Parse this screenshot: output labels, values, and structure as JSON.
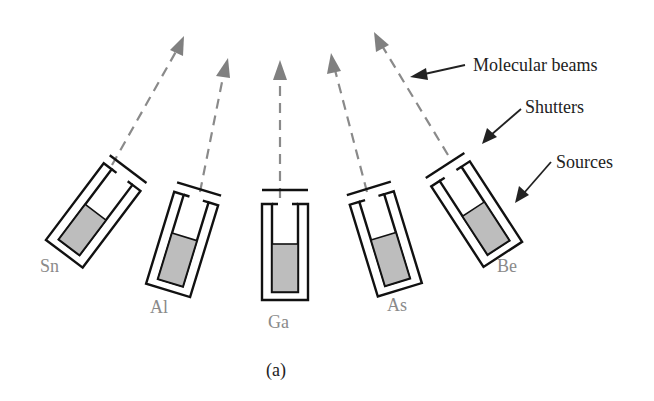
{
  "figure": {
    "caption": "(a)",
    "callouts": {
      "molecular_beams": "Molecular beams",
      "shutters": "Shutters",
      "sources": "Sources"
    },
    "sources": [
      {
        "label": "Sn",
        "angle": 37,
        "cx": 90,
        "cy": 218,
        "label_x": 40,
        "label_y": 272
      },
      {
        "label": "Al",
        "angle": 17,
        "cx": 180,
        "cy": 248,
        "label_x": 150,
        "label_y": 313
      },
      {
        "label": "Ga",
        "angle": 0,
        "cx": 284,
        "cy": 256,
        "label_x": 268,
        "label_y": 328
      },
      {
        "label": "As",
        "angle": -17,
        "cx": 386,
        "cy": 248,
        "label_x": 387,
        "label_y": 311
      },
      {
        "label": "Be",
        "angle": -33,
        "cx": 478,
        "cy": 218,
        "label_x": 497,
        "label_y": 272
      }
    ],
    "colors": {
      "beam": "#8a8a8a",
      "outline": "#111111",
      "fill": "#bdbdbd",
      "source_label": "#8a8a8a",
      "text": "#222222"
    }
  }
}
